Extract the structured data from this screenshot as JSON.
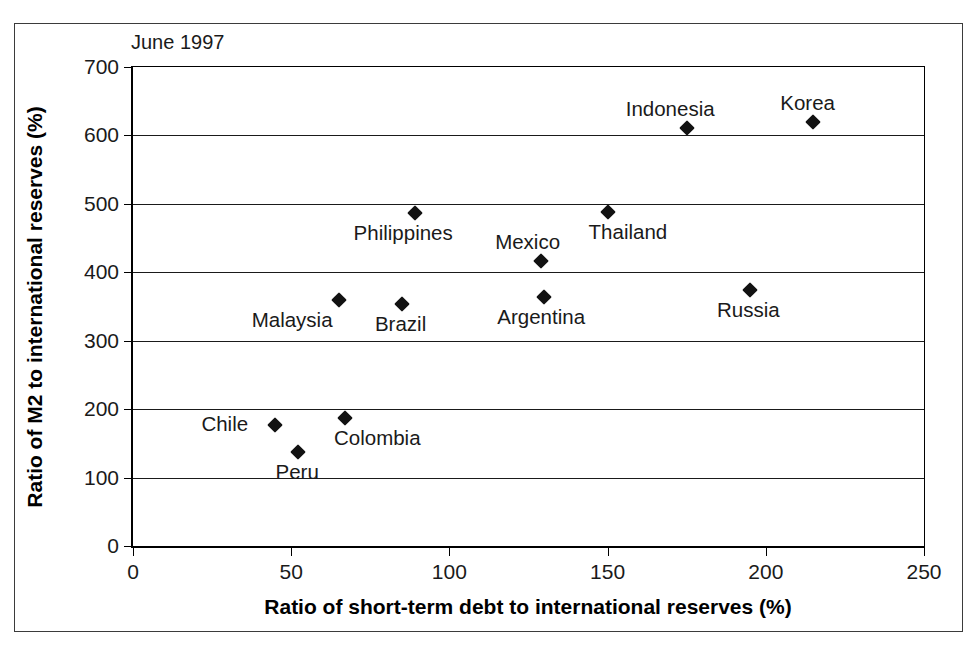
{
  "figure": {
    "note": "June 1997",
    "background": "#ffffff",
    "frame_color": "#3b3b3b",
    "marker_color": "#121212"
  },
  "chart_data": {
    "type": "scatter",
    "title": "June 1997",
    "xlabel": "Ratio of short-term debt to international reserves (%)",
    "ylabel": "Ratio of M2 to international reserves (%)",
    "xlim": [
      0,
      250
    ],
    "ylim": [
      0,
      700
    ],
    "xticks": [
      0,
      50,
      100,
      150,
      200,
      250
    ],
    "yticks": [
      0,
      100,
      200,
      300,
      400,
      500,
      600,
      700
    ],
    "grid": "horizontal",
    "legend": "none",
    "marker": "diamond",
    "points": [
      {
        "label": "Chile",
        "x": 45,
        "y": 177,
        "label_dx": -74,
        "label_dy": -11
      },
      {
        "label": "Peru",
        "x": 52,
        "y": 138,
        "label_dx": -22,
        "label_dy": 10
      },
      {
        "label": "Colombia",
        "x": 67,
        "y": 187,
        "label_dx": -11,
        "label_dy": 10
      },
      {
        "label": "Malaysia",
        "x": 65,
        "y": 360,
        "label_dx": -87,
        "label_dy": 10
      },
      {
        "label": "Brazil",
        "x": 85,
        "y": 353,
        "label_dx": -27,
        "label_dy": 10
      },
      {
        "label": "Philippines",
        "x": 89,
        "y": 486,
        "label_dx": -61,
        "label_dy": 10
      },
      {
        "label": "Argentina",
        "x": 130,
        "y": 364,
        "label_dx": -47,
        "label_dy": 10
      },
      {
        "label": "Mexico",
        "x": 129,
        "y": 417,
        "label_dx": -46,
        "label_dy": -29
      },
      {
        "label": "Thailand",
        "x": 150,
        "y": 488,
        "label_dx": -19,
        "label_dy": 10
      },
      {
        "label": "Indonesia",
        "x": 175,
        "y": 611,
        "label_dx": -61,
        "label_dy": -29
      },
      {
        "label": "Russia",
        "x": 195,
        "y": 374,
        "label_dx": -33,
        "label_dy": 10
      },
      {
        "label": "Korea",
        "x": 215,
        "y": 619,
        "label_dx": -33,
        "label_dy": -29
      }
    ]
  }
}
